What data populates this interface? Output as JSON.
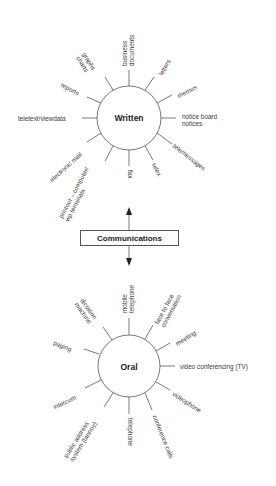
{
  "diagram": {
    "center_label": "Communications",
    "written": {
      "label": "Written",
      "items": [
        "business documents",
        "letters",
        "memos",
        "notice board notices",
        "telemessages",
        "telex",
        "fax",
        "printout – computer/ wp terminals",
        "electronic mail",
        "teletext/viewdata",
        "reports",
        "graphs charts"
      ]
    },
    "oral": {
      "label": "Oral",
      "items": [
        "mobile telephone",
        "face to face conversation",
        "meeting",
        "video conferencing (TV)",
        "videophone",
        "conference calls",
        "telephone",
        "public address system (tannoy)",
        "intercom",
        "paging",
        "dictation machine"
      ]
    }
  },
  "labels": {
    "w_business_1": "business",
    "w_business_2": "documents",
    "w_letters": "letters",
    "w_memos": "memos",
    "w_notice_1": "notice board",
    "w_notice_2": "notices",
    "w_telemessages": "telemessages",
    "w_telex": "telex",
    "w_fax": "fax",
    "w_printout_1": "printout – computer/",
    "w_printout_2": "wp terminals",
    "w_email": "electronic mail",
    "w_teletext": "teletext/viewdata",
    "w_reports": "reports",
    "w_graphs_1": "graphs",
    "w_graphs_2": "charts",
    "o_mobile_1": "mobile",
    "o_mobile_2": "telephone",
    "o_face_1": "face to face",
    "o_face_2": "conversation",
    "o_meeting": "meeting",
    "o_video_conf": "video conferencing (TV)",
    "o_videophone": "videophone",
    "o_conf_calls": "conference calls",
    "o_telephone": "telephone",
    "o_pa_1": "public address",
    "o_pa_2": "system (tannoy)",
    "o_intercom": "intercom",
    "o_paging": "paging",
    "o_dictation_1": "dictation",
    "o_dictation_2": "machine"
  }
}
